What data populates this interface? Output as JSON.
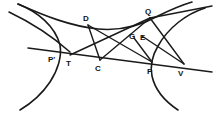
{
  "figure": {
    "background_color": "#ffffff",
    "ink_color": "#1a1a1a",
    "width": 223,
    "height": 115,
    "labels": [
      {
        "id": "P-prime",
        "text": "P'",
        "x": 48,
        "y": 56
      },
      {
        "id": "T",
        "text": "T",
        "x": 66,
        "y": 60
      },
      {
        "id": "C",
        "text": "C",
        "x": 95,
        "y": 65
      },
      {
        "id": "D",
        "text": "D",
        "x": 83,
        "y": 15
      },
      {
        "id": "Q",
        "text": "Q",
        "x": 145,
        "y": 8
      },
      {
        "id": "G",
        "text": "G",
        "x": 129,
        "y": 33
      },
      {
        "id": "E",
        "text": "E",
        "x": 140,
        "y": 34
      },
      {
        "id": "P",
        "text": "P",
        "x": 147,
        "y": 68
      },
      {
        "id": "V",
        "text": "V",
        "x": 178,
        "y": 70
      }
    ],
    "points": {
      "P_prime": {
        "x": 55,
        "y": 52
      },
      "T": {
        "x": 70,
        "y": 55
      },
      "C": {
        "x": 100,
        "y": 60
      },
      "D": {
        "x": 88,
        "y": 25
      },
      "Q": {
        "x": 150,
        "y": 18
      },
      "G": {
        "x": 134,
        "y": 38
      },
      "E": {
        "x": 142,
        "y": 39
      },
      "P": {
        "x": 152,
        "y": 62
      },
      "V": {
        "x": 184,
        "y": 64
      }
    },
    "elements": [
      {
        "id": "left-branch",
        "kind": "curve",
        "description": "left branch of hyperbola through P'"
      },
      {
        "id": "right-branch",
        "kind": "curve",
        "description": "right branch of hyperbola through P"
      },
      {
        "id": "upper-asymptote-left",
        "kind": "asymptote",
        "description": "asymptote rising to upper-left"
      },
      {
        "id": "upper-asymptote-right",
        "kind": "asymptote",
        "description": "asymptote rising to upper-right"
      },
      {
        "id": "secant-TV",
        "kind": "axis-line",
        "description": "straight line through P', T, C, P, V"
      },
      {
        "id": "chord-DP",
        "kind": "chord",
        "description": "chord from D to P"
      },
      {
        "id": "chord-DC",
        "kind": "chord",
        "description": "segment D to C"
      },
      {
        "id": "chord-TQ",
        "kind": "chord",
        "description": "segment T through G,E to Q"
      },
      {
        "id": "chord-CQ",
        "kind": "chord",
        "description": "segment C to Q"
      },
      {
        "id": "chord-QV",
        "kind": "chord",
        "description": "segment Q to V"
      }
    ]
  }
}
